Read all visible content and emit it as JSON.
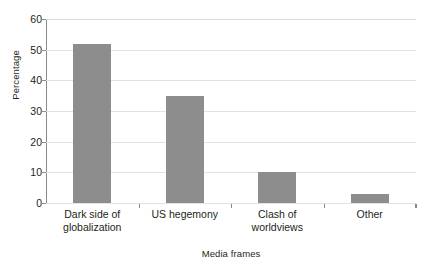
{
  "chart_data": {
    "type": "bar",
    "title": "",
    "subtitle": "",
    "xlabel": "Media frames",
    "ylabel": "Percentage",
    "categories": [
      "Dark side of globalization",
      "US hegemony",
      "Clash of worldviews",
      "Other"
    ],
    "category_lines": [
      [
        "Dark side of",
        "globalization"
      ],
      [
        "US hegemony",
        ""
      ],
      [
        "Clash of",
        "worldviews"
      ],
      [
        "Other",
        ""
      ]
    ],
    "values": [
      52,
      35,
      10,
      3
    ],
    "ylim": [
      0,
      60
    ],
    "yticks": [
      0,
      10,
      20,
      30,
      40,
      50,
      60
    ],
    "ytick_labels": [
      "0",
      "10",
      "20",
      "30",
      "40",
      "50",
      "60"
    ],
    "grid": true,
    "grid_axis": "y",
    "legend": false,
    "legend_position": "none",
    "bar_color": "#8d8d8d",
    "grid_color": "#e3e3e4",
    "axis_color": "#8a8a8c",
    "text_color": "#231f20",
    "background": "#ffffff"
  }
}
